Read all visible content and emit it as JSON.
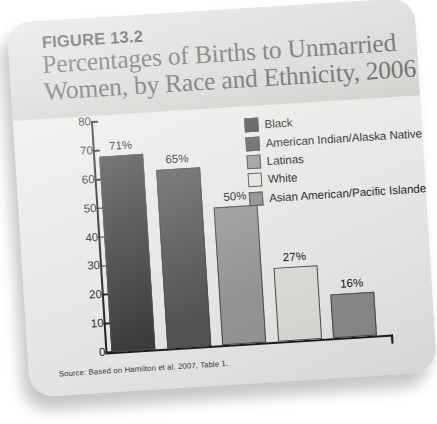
{
  "figure": {
    "label": "FIGURE 13.2",
    "title": "Percentages of Births to Unmarried Women, by Race and Ethnicity, 2006",
    "source": "Source: Based on Hamilton et al. 2007, Table 1."
  },
  "chart_data": {
    "type": "bar",
    "title": "Percentages of Births to Unmarried Women, by Race and Ethnicity, 2006",
    "xlabel": "",
    "ylabel": "",
    "ylim": [
      0,
      80
    ],
    "yticks": [
      0,
      10,
      20,
      30,
      40,
      50,
      60,
      70,
      80
    ],
    "ytick_labels": [
      "0",
      "10",
      "20",
      "30",
      "40",
      "50",
      "60",
      "70",
      "80"
    ],
    "grid": false,
    "legend_position": "upper-right",
    "categories": [
      "Black",
      "American Indian/Alaska Native",
      "Latinas",
      "White",
      "Asian American/Pacific Islander"
    ],
    "values": [
      71,
      65,
      50,
      27,
      16
    ],
    "data_labels": [
      "71%",
      "65%",
      "50%",
      "27%",
      "16%"
    ],
    "colors": [
      "#3f3f40",
      "#575757",
      "#9a9a9a",
      "#e2e2df",
      "#8e8e8e"
    ]
  },
  "legend": {
    "items": [
      {
        "label": "Black",
        "color": "#3f3f40"
      },
      {
        "label": "American Indian/Alaska Native",
        "color": "#575757"
      },
      {
        "label": "Latinas",
        "color": "#9a9a9a"
      },
      {
        "label": "White",
        "color": "#e9e9e6"
      },
      {
        "label": "Asian American/Pacific Islander",
        "color": "#8e8e8e"
      }
    ]
  },
  "theme": {
    "card_background": "#eeeeec",
    "header_band": "#d5d5d2",
    "axis_color": "#1c1c1c",
    "title_color": "#4d4d4d"
  }
}
